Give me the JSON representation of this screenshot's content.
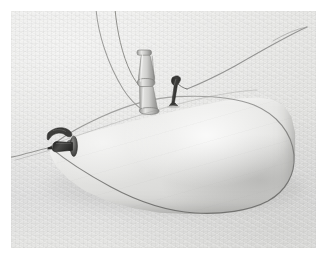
{
  "image": {
    "kind": "photograph",
    "subject": "inflated fabric bag with tube and valve fittings",
    "alt_text": "Pale tapering fabric bag lying on a light cloth background, with a rubber tube and metal valve fittings attached at its narrow upper side and a dark nozzle with a flange disc at its left tip, cords running off the top of the frame"
  },
  "colors": {
    "mount": "#ffffff",
    "background_cloth": "#e3e3e1",
    "background_highlight": "#ededeb",
    "background_shadow": "#d4d4d2",
    "bag_light": "#ededeb",
    "bag_mid": "#e2e2e0",
    "bag_shadow": "#cfcfcd",
    "bag_outline": "#8e8e8c",
    "tube_light": "#dcdcda",
    "tube_mid": "#c3c3c1",
    "tube_shadow": "#9a9a98",
    "fitting_dark": "#3a3a38",
    "clip_dark": "#2f2f2d",
    "cord": "#7c7c7a",
    "cast_shadow": "#8c8c8a"
  },
  "geometry": {
    "frame": {
      "x": 11,
      "y": 11,
      "width": 305,
      "height": 237
    },
    "bag": {
      "x": 38,
      "y": 84,
      "width": 246,
      "height": 119
    }
  },
  "elements": {
    "bag_label": "inflated bag body",
    "tube_label": "rubber tube with collar joints",
    "clip_label": "dark angled metal clip",
    "nozzle_label": "dark nozzle with flange disc",
    "hook_label": "dark curved hook",
    "cord_left_label": "thin cord rising to top of frame",
    "cord_right_label": "thin cord rising to upper right corner",
    "cord_tail_label": "thin cord trailing off to the left"
  },
  "annotations": []
}
